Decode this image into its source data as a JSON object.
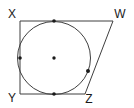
{
  "figure": {
    "background_color": "#ffffff",
    "stroke_color": "#3f3f3f",
    "point_color": "#1a1a1a",
    "label_color": "#1a1a1a",
    "stroke_width": 1,
    "labels": {
      "x": "X",
      "w": "W",
      "y": "Y",
      "z": "Z"
    },
    "vertices": {
      "x": {
        "cx": 20,
        "cy": 21
      },
      "w": {
        "cx": 113,
        "cy": 21
      },
      "y": {
        "cx": 20,
        "cy": 94
      },
      "z": {
        "cx": 85,
        "cy": 94
      }
    },
    "label_positions": {
      "x": {
        "tx": 12,
        "ty": 15
      },
      "w": {
        "tx": 120,
        "ty": 15
      },
      "y": {
        "tx": 12,
        "ty": 99
      },
      "z": {
        "tx": 89,
        "ty": 100
      }
    },
    "circle": {
      "cx": 54,
      "cy": 58,
      "r": 36.5
    },
    "center_point": {
      "cx": 54,
      "cy": 58,
      "r": 1.7
    },
    "tangent_points": [
      {
        "name": "tangent-top",
        "cx": 54,
        "cy": 21,
        "r": 1.8
      },
      {
        "name": "tangent-left",
        "cx": 20,
        "cy": 58,
        "r": 1.8
      },
      {
        "name": "tangent-bottom",
        "cx": 54,
        "cy": 94,
        "r": 1.8
      },
      {
        "name": "tangent-right",
        "cx": 88,
        "cy": 71,
        "r": 2.0
      }
    ],
    "polygon_points": "20,21 113,21 85,94 20,94"
  }
}
